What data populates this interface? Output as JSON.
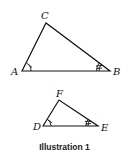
{
  "diagram": {
    "triangle1": {
      "vertices": {
        "A": "A",
        "B": "B",
        "C": "C"
      },
      "angle_marks": {
        "A": "single tick",
        "B": "double tick"
      }
    },
    "triangle2": {
      "vertices": {
        "D": "D",
        "E": "E",
        "F": "F"
      },
      "angle_marks": {
        "D": "single tick",
        "E": "double tick"
      }
    },
    "caption": "Illustration 1"
  }
}
